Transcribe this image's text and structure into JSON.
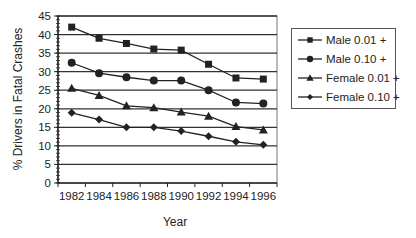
{
  "chart_data": {
    "type": "line",
    "title": "",
    "xlabel": "Year",
    "ylabel": "% Drivers in Fatal Crashes",
    "categories": [
      "1982",
      "1984",
      "1986",
      "1988",
      "1990",
      "1992",
      "1994",
      "1996"
    ],
    "ylim": [
      0,
      45
    ],
    "yticks": [
      0,
      5,
      10,
      15,
      20,
      25,
      30,
      35,
      40,
      45
    ],
    "grid": true,
    "legend_position": "right",
    "series": [
      {
        "name": "Male 0.01 +",
        "marker": "square",
        "values": [
          42.0,
          39.0,
          37.6,
          36.1,
          35.8,
          32.0,
          28.3,
          28.0
        ]
      },
      {
        "name": "Male 0.10 +",
        "marker": "circle",
        "values": [
          32.4,
          29.6,
          28.5,
          27.6,
          27.6,
          25.0,
          21.7,
          21.4
        ]
      },
      {
        "name": "Female 0.01 +",
        "marker": "triangle",
        "values": [
          25.5,
          23.6,
          20.8,
          20.3,
          19.1,
          18.0,
          15.2,
          14.3
        ]
      },
      {
        "name": "Female 0.10 +",
        "marker": "diamond",
        "values": [
          18.9,
          17.1,
          15.0,
          15.0,
          14.0,
          12.6,
          11.1,
          10.3
        ]
      }
    ]
  },
  "colors": {
    "line": "#222222",
    "grid": "#333333",
    "axis": "#222222"
  }
}
